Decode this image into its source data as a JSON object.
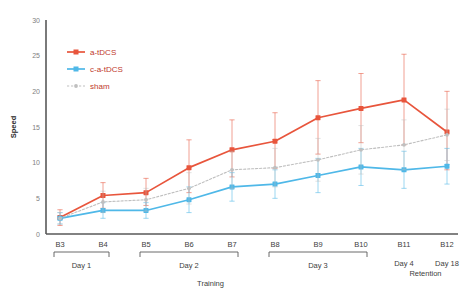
{
  "chart_data": {
    "type": "line",
    "title": "",
    "xlabel": "Training",
    "ylabel": "Speed",
    "ylim": [
      0,
      30
    ],
    "yticks": [
      0,
      5,
      10,
      15,
      20,
      25,
      30
    ],
    "categories": [
      "B3",
      "B4",
      "B5",
      "B6",
      "B7",
      "B8",
      "B9",
      "B10",
      "B11",
      "B12"
    ],
    "grid": false,
    "legend_position": "top-left",
    "series": [
      {
        "name": "a-tDCS",
        "color": "#e8553c",
        "values": [
          2.3,
          5.4,
          5.8,
          9.3,
          11.8,
          13.0,
          16.3,
          17.6,
          18.8,
          14.3
        ],
        "err_upper": [
          3.4,
          7.2,
          7.8,
          13.2,
          16.0,
          17.0,
          21.5,
          22.5,
          25.2,
          20.0
        ],
        "err_lower": [
          1.2,
          3.6,
          4.0,
          5.8,
          8.0,
          9.2,
          11.2,
          12.8,
          12.5,
          9.0
        ]
      },
      {
        "name": "c-a-tDCS",
        "color": "#4fb8e8",
        "values": [
          2.2,
          3.3,
          3.3,
          4.8,
          6.6,
          7.0,
          8.2,
          9.4,
          9.0,
          9.5
        ],
        "err_upper": [
          3.0,
          4.4,
          4.4,
          6.6,
          8.6,
          9.0,
          10.6,
          12.0,
          11.6,
          12.0
        ],
        "err_lower": [
          1.4,
          2.2,
          2.2,
          3.0,
          4.6,
          5.0,
          5.8,
          6.8,
          6.4,
          7.0
        ]
      },
      {
        "name": "sham",
        "color": "#bfbfbf",
        "values": [
          2.2,
          4.5,
          4.8,
          6.4,
          9.0,
          9.3,
          10.4,
          11.8,
          12.5,
          13.9
        ],
        "err_upper": [
          3.0,
          6.0,
          6.4,
          8.6,
          11.6,
          12.0,
          13.4,
          15.2,
          16.0,
          17.5
        ],
        "err_lower": [
          1.4,
          3.0,
          3.2,
          4.2,
          6.4,
          6.6,
          7.4,
          8.4,
          9.0,
          10.3
        ]
      }
    ],
    "x_groups": [
      {
        "label": "Day 1",
        "from": "B3",
        "to": "B4",
        "bracket": true
      },
      {
        "label": "Day 2",
        "from": "B5",
        "to": "B7",
        "bracket": true
      },
      {
        "label": "Day 3",
        "from": "B8",
        "to": "B10",
        "bracket": true
      },
      {
        "label": "Day 4",
        "from": "B11",
        "to": "B11",
        "bracket": false
      },
      {
        "label": "Day 18",
        "from": "B12",
        "to": "B12",
        "bracket": false
      }
    ],
    "annotations": [
      "Retention"
    ]
  },
  "legend": {
    "items": [
      {
        "label": "a-tDCS",
        "color": "#e8553c"
      },
      {
        "label": "c-a-tDCS",
        "color": "#4fb8e8"
      },
      {
        "label": "sham",
        "color": "#bfbfbf"
      }
    ]
  },
  "labels": {
    "retention": "Retention",
    "training": "Training",
    "speed": "Speed"
  }
}
